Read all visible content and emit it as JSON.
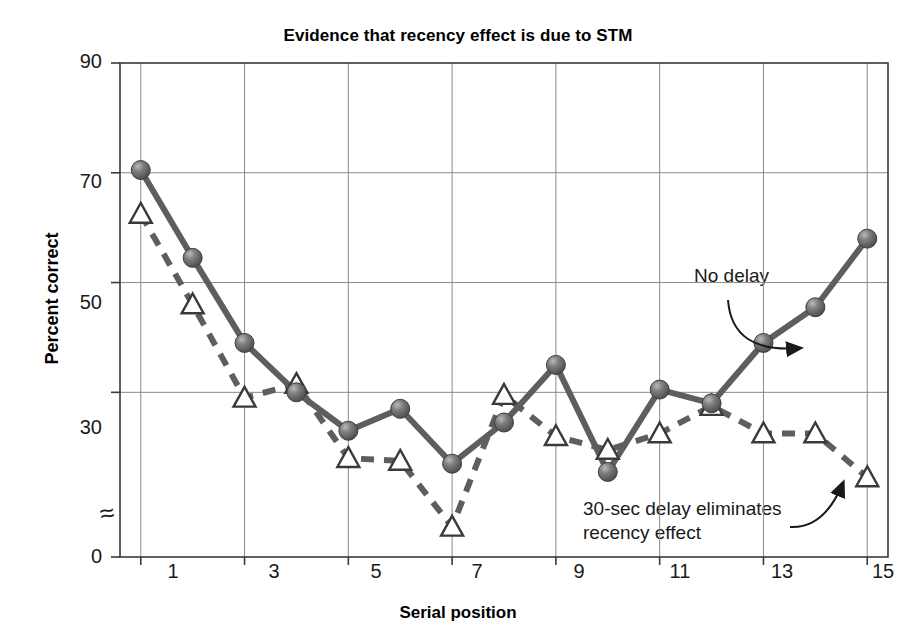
{
  "chart_data": {
    "type": "line",
    "title": "Evidence that recency effect is due to STM",
    "xlabel": "Serial position",
    "ylabel": "Percent correct",
    "x": [
      1,
      2,
      3,
      4,
      5,
      6,
      7,
      8,
      9,
      10,
      11,
      12,
      13,
      14,
      15
    ],
    "xlim": [
      0.6,
      15.4
    ],
    "ylim": [
      0,
      90
    ],
    "yticks": [
      0,
      30,
      50,
      70,
      90
    ],
    "xticks": [
      1,
      3,
      5,
      7,
      9,
      11,
      13,
      15
    ],
    "y_axis_break": true,
    "y_axis_break_symbol": "≈",
    "grid": true,
    "legend_position": "none",
    "series": [
      {
        "name": "No delay",
        "marker": "filled-sphere",
        "linestyle": "solid",
        "color": "#5e5e5e",
        "values": [
          70.5,
          54.5,
          39,
          30,
          23,
          27,
          17,
          24.5,
          35,
          15.5,
          30.5,
          28,
          39,
          45.5,
          58
        ]
      },
      {
        "name": "30-sec delay eliminates recency effect",
        "marker": "open-triangle",
        "linestyle": "dashed",
        "color": "#5e5e5e",
        "values": [
          62.5,
          46,
          29,
          31.5,
          18,
          17.5,
          5.5,
          29.5,
          22,
          19.5,
          22.5,
          27.5,
          22.5,
          22.5,
          14.5
        ]
      }
    ],
    "annotations": [
      {
        "text": "No delay",
        "x_px": 694,
        "y_px": 264,
        "arrow_from_px": [
          728,
          300
        ],
        "arrow_to_px": [
          800,
          348
        ]
      },
      {
        "text": "30-sec delay eliminates\nrecency effect",
        "x_px": 583,
        "y_px": 497,
        "arrow_from_px": [
          790,
          527
        ],
        "arrow_to_px": [
          843,
          483
        ]
      }
    ]
  },
  "axes": {
    "y_tick_labels": [
      "90",
      "70",
      "50",
      "30",
      "0"
    ],
    "x_tick_labels": [
      "1",
      "3",
      "5",
      "7",
      "9",
      "11",
      "13",
      "15"
    ]
  },
  "colors": {
    "line": "#5e5e5e",
    "marker_fill": "#6f6f6f",
    "grid": "#8a8a8a",
    "frame": "#3a3a3a",
    "text": "#1a1a1a"
  }
}
